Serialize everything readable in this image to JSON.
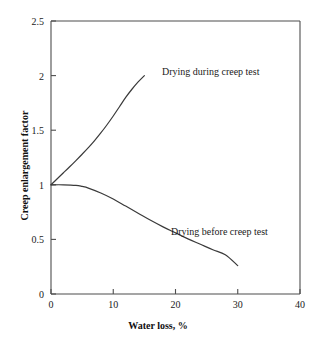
{
  "chart_data": {
    "type": "line",
    "title": "",
    "xlabel": "Water loss, %",
    "ylabel": "Creep enlargement factor",
    "xlim": [
      0,
      40
    ],
    "ylim": [
      0,
      2.5
    ],
    "xticks": [
      "0",
      "10",
      "20",
      "30",
      "40"
    ],
    "xtick_values": [
      0,
      10,
      20,
      30,
      40
    ],
    "yticks": [
      "0",
      "0.5",
      "1",
      "1.5",
      "2",
      "2.5"
    ],
    "ytick_values": [
      0,
      0.5,
      1,
      1.5,
      2,
      2.5
    ],
    "grid": false,
    "legend_position": "inline-annotations",
    "line_color": "#3a3a3a",
    "axis_color": "#4d4d4d",
    "series": [
      {
        "name": "Drying during creep test",
        "annotation": "Drying during creep test",
        "x": [
          0,
          1,
          2,
          3,
          4,
          5,
          6,
          7,
          8,
          9,
          10,
          11,
          12,
          13,
          14,
          15
        ],
        "values": [
          1.0,
          1.055,
          1.11,
          1.165,
          1.222,
          1.28,
          1.34,
          1.405,
          1.475,
          1.55,
          1.63,
          1.715,
          1.8,
          1.875,
          1.942,
          2.0
        ]
      },
      {
        "name": "Drying before creep test",
        "annotation": "Drying before creep test",
        "x": [
          0,
          2,
          4,
          5,
          6,
          8,
          10,
          12,
          14,
          16,
          18,
          20,
          22,
          24,
          26,
          28,
          30
        ],
        "values": [
          1.0,
          1.0,
          0.995,
          0.985,
          0.97,
          0.925,
          0.87,
          0.805,
          0.74,
          0.675,
          0.615,
          0.56,
          0.505,
          0.455,
          0.405,
          0.36,
          0.26
        ]
      }
    ]
  }
}
